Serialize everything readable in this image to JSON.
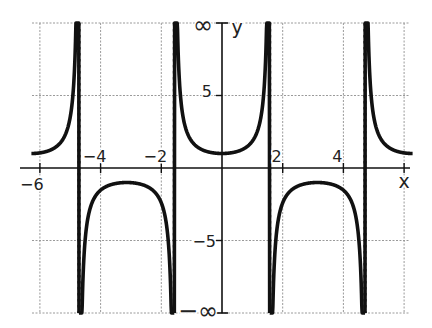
{
  "chart_data": {
    "type": "line",
    "title": "",
    "function": "y = sec(x)",
    "xlabel": "x",
    "ylabel": "y",
    "xlim": [
      -6.28,
      6.28
    ],
    "ylim": [
      -10,
      10
    ],
    "grid": true,
    "x_ticks": [
      -6,
      -4,
      -2,
      2,
      4
    ],
    "x_tick_labels": [
      "−6",
      "−4",
      "−2",
      "2",
      "4"
    ],
    "x_gridlines": [
      -6,
      -4,
      -2,
      0,
      2,
      4,
      6
    ],
    "y_ticks": [
      5,
      -5
    ],
    "y_tick_labels": [
      "5",
      "−5"
    ],
    "y_gridlines": [
      10,
      5,
      -5,
      -10
    ],
    "y_top_label": "∞",
    "y_bottom_label": "−∞",
    "asymptotes": [
      -4.712,
      -1.571,
      1.571,
      4.712
    ],
    "series": [
      {
        "name": "sec(x)",
        "points_sample": [
          {
            "x": -6.28,
            "y": 1.0
          },
          {
            "x": -5.5,
            "y": 1.41
          },
          {
            "x": -3.14,
            "y": -1.0
          },
          {
            "x": 0,
            "y": 1.0
          },
          {
            "x": 3.14,
            "y": -1.0
          },
          {
            "x": 5.5,
            "y": 1.41
          },
          {
            "x": 6.28,
            "y": 1.0
          }
        ]
      }
    ],
    "legend": []
  },
  "labels": {
    "x_axis": "x",
    "y_axis": "y",
    "inf": "∞",
    "neg_inf": "−∞",
    "x_ticks": [
      "−6",
      "−4",
      "−2",
      "2",
      "4"
    ],
    "y_ticks": [
      "5",
      "−5"
    ]
  }
}
